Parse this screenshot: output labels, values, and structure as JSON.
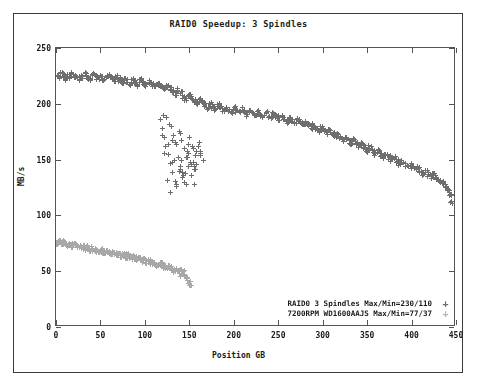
{
  "chart_data": {
    "type": "scatter",
    "title": "RAID0 Speedup:  3 Spindles",
    "xlabel": "Position GB",
    "ylabel": "MB/s",
    "xlim": [
      0,
      450
    ],
    "ylim": [
      0,
      250
    ],
    "xticks": [
      0,
      50,
      100,
      150,
      200,
      250,
      300,
      350,
      400,
      450
    ],
    "yticks": [
      0,
      50,
      100,
      150,
      200,
      250
    ],
    "grid": false,
    "legend_position": "inside-bottom-right",
    "marker": "+",
    "series": [
      {
        "name": "RAID0 3 Spindles Max/Min=230/110",
        "legend_label": "RAID0 3 Spindles Max/Min=230/110",
        "marker": "+",
        "color": "#6e6e6e",
        "max": 230,
        "min": 110,
        "x": [
          2,
          5,
          8,
          11,
          14,
          17,
          20,
          23,
          26,
          29,
          32,
          35,
          38,
          41,
          44,
          47,
          50,
          53,
          56,
          59,
          62,
          65,
          68,
          71,
          74,
          77,
          80,
          83,
          86,
          89,
          92,
          95,
          98,
          101,
          104,
          107,
          110,
          113,
          116,
          119,
          122,
          125,
          128,
          131,
          134,
          137,
          140,
          143,
          146,
          149,
          152,
          155,
          158,
          161,
          164,
          167,
          170,
          173,
          176,
          179,
          182,
          185,
          188,
          191,
          194,
          197,
          200,
          203,
          206,
          209,
          212,
          215,
          218,
          221,
          224,
          227,
          230,
          233,
          236,
          239,
          242,
          245,
          248,
          251,
          254,
          257,
          260,
          263,
          266,
          269,
          272,
          275,
          278,
          281,
          284,
          287,
          290,
          293,
          296,
          299,
          302,
          305,
          308,
          311,
          314,
          317,
          320,
          323,
          326,
          329,
          332,
          335,
          338,
          341,
          344,
          347,
          350,
          353,
          356,
          359,
          362,
          365,
          368,
          371,
          374,
          377,
          380,
          383,
          386,
          389,
          392,
          395,
          398,
          401,
          404,
          407,
          410,
          413,
          416,
          419,
          422,
          425,
          428,
          431,
          434,
          437,
          440,
          443,
          445
        ],
        "y": [
          224,
          228,
          226,
          222,
          225,
          227,
          224,
          226,
          223,
          225,
          227,
          224,
          222,
          226,
          224,
          223,
          225,
          222,
          224,
          226,
          223,
          221,
          224,
          222,
          220,
          223,
          221,
          219,
          222,
          220,
          218,
          221,
          219,
          217,
          220,
          218,
          216,
          219,
          217,
          215,
          213,
          216,
          214,
          211,
          209,
          212,
          210,
          207,
          205,
          208,
          206,
          203,
          201,
          204,
          202,
          199,
          197,
          200,
          198,
          196,
          199,
          197,
          195,
          197,
          195,
          193,
          196,
          194,
          192,
          195,
          193,
          191,
          194,
          192,
          190,
          193,
          191,
          189,
          192,
          190,
          188,
          191,
          189,
          187,
          189,
          187,
          185,
          187,
          185,
          183,
          185,
          183,
          181,
          183,
          181,
          179,
          181,
          179,
          177,
          179,
          176,
          174,
          176,
          173,
          171,
          173,
          170,
          168,
          170,
          167,
          165,
          167,
          164,
          162,
          164,
          161,
          159,
          161,
          158,
          156,
          158,
          155,
          153,
          155,
          152,
          150,
          152,
          149,
          147,
          149,
          146,
          144,
          146,
          143,
          141,
          143,
          140,
          138,
          140,
          137,
          135,
          137,
          134,
          132,
          130,
          127,
          124,
          118,
          112
        ],
        "outliers_x": [
          117,
          119,
          121,
          123,
          124,
          126,
          128,
          129,
          131,
          132,
          134,
          135,
          137,
          138,
          140,
          141,
          143,
          144,
          146,
          147,
          149,
          150,
          152,
          153,
          155,
          156,
          158,
          160,
          162,
          119,
          126,
          133,
          140,
          147,
          154,
          161,
          122,
          130,
          138,
          146,
          154,
          162,
          125,
          135,
          145,
          155,
          165,
          128,
          142,
          156,
          131,
          148,
          135,
          152,
          139,
          158,
          142,
          127,
          134,
          141,
          148,
          155,
          162,
          120,
          144,
          151
        ],
        "outliers_y": [
          186,
          178,
          170,
          162,
          188,
          155,
          147,
          180,
          139,
          172,
          131,
          164,
          152,
          176,
          144,
          168,
          136,
          160,
          128,
          152,
          144,
          170,
          136,
          162,
          128,
          154,
          146,
          162,
          158,
          172,
          164,
          150,
          142,
          158,
          148,
          166,
          156,
          148,
          140,
          152,
          160,
          154,
          132,
          126,
          138,
          144,
          150,
          121,
          134,
          142,
          168,
          156,
          128,
          146,
          174,
          158,
          139,
          182,
          166,
          150,
          164,
          142,
          156,
          190,
          130,
          148
        ]
      },
      {
        "name": "7200RPM WD1600AAJS Max/Min=77/37",
        "legend_label": "7200RPM WD1600AAJS Max/Min=77/37",
        "marker": "+",
        "color": "#a8a8a8",
        "max": 77,
        "min": 37,
        "x": [
          1,
          3,
          5,
          7,
          9,
          11,
          13,
          15,
          17,
          19,
          21,
          23,
          25,
          27,
          29,
          31,
          33,
          35,
          37,
          39,
          41,
          43,
          45,
          47,
          49,
          51,
          53,
          55,
          57,
          59,
          61,
          63,
          65,
          67,
          69,
          71,
          73,
          75,
          77,
          79,
          81,
          83,
          85,
          87,
          89,
          91,
          93,
          95,
          97,
          99,
          101,
          103,
          105,
          107,
          109,
          111,
          113,
          115,
          117,
          119,
          121,
          123,
          125,
          127,
          129,
          131,
          133,
          135,
          137,
          139,
          141,
          143,
          145,
          147,
          149,
          151
        ],
        "y": [
          76,
          77,
          76,
          75,
          76,
          75,
          74,
          75,
          74,
          73,
          74,
          73,
          72,
          73,
          72,
          71,
          72,
          71,
          70,
          71,
          70,
          69,
          70,
          69,
          68,
          69,
          68,
          67,
          68,
          67,
          66,
          67,
          66,
          65,
          66,
          65,
          64,
          65,
          64,
          63,
          64,
          63,
          62,
          63,
          62,
          61,
          62,
          61,
          60,
          61,
          59,
          60,
          58,
          59,
          57,
          58,
          56,
          57,
          55,
          56,
          54,
          55,
          53,
          54,
          52,
          53,
          51,
          52,
          50,
          51,
          48,
          49,
          46,
          44,
          41,
          38
        ]
      }
    ]
  }
}
